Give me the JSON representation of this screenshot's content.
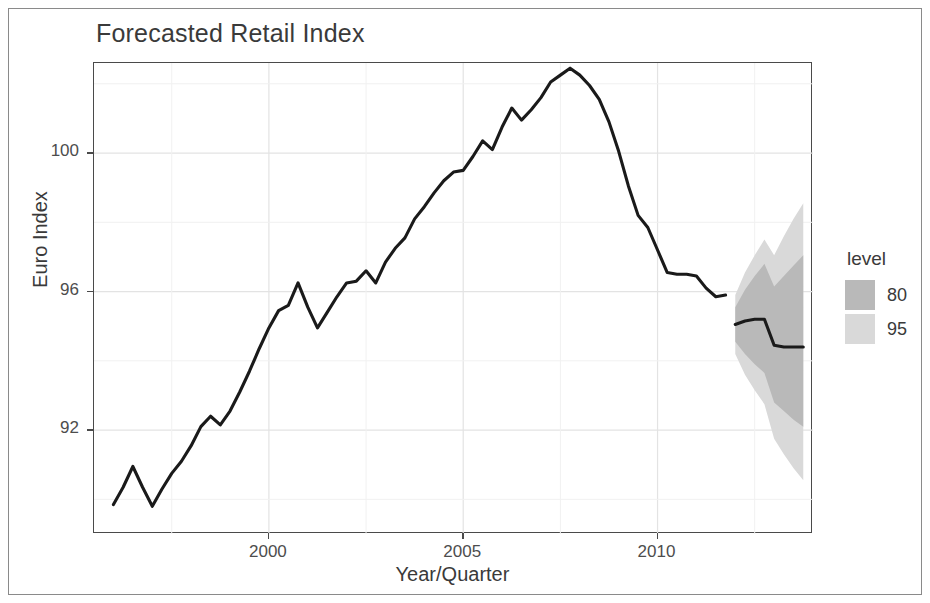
{
  "figure": {
    "title": "Forecasted Retail Index",
    "background": "#ffffff",
    "frame_color": "#8a8a8a"
  },
  "axes": {
    "ylabel": "Euro Index",
    "xlabel": "Year/Quarter",
    "y_ticks": [
      92,
      96,
      100
    ],
    "x_ticks": [
      2000,
      2005,
      2010
    ],
    "y_tick_labels": [
      "92",
      "96",
      "100"
    ],
    "x_tick_labels": [
      "2000",
      "2005",
      "2010"
    ],
    "grid": true,
    "panel_border_color": "#4a4a4a",
    "tick_label_color": "#4d4d4d"
  },
  "legend": {
    "title": "level",
    "position": "right",
    "items": [
      {
        "label": "80",
        "color": "#b9b9b9"
      },
      {
        "label": "95",
        "color": "#d9d9d9"
      }
    ]
  },
  "chart_data": {
    "type": "line",
    "title": "Forecasted Retail Index",
    "xlabel": "Year/Quarter",
    "ylabel": "Euro Index",
    "xlim": [
      1995.5,
      2014.0
    ],
    "ylim": [
      89.0,
      102.6
    ],
    "grid": true,
    "legend_position": "right",
    "legend_title": "level",
    "line_color": "#1a1a1a",
    "series": [
      {
        "name": "Euro Index (observed)",
        "type": "line",
        "x": [
          1996.0,
          1996.25,
          1996.5,
          1996.75,
          1997.0,
          1997.25,
          1997.5,
          1997.75,
          1998.0,
          1998.25,
          1998.5,
          1998.75,
          1999.0,
          1999.25,
          1999.5,
          1999.75,
          2000.0,
          2000.25,
          2000.5,
          2000.75,
          2001.0,
          2001.25,
          2001.5,
          2001.75,
          2002.0,
          2002.25,
          2002.5,
          2002.75,
          2003.0,
          2003.25,
          2003.5,
          2003.75,
          2004.0,
          2004.25,
          2004.5,
          2004.75,
          2005.0,
          2005.25,
          2005.5,
          2005.75,
          2006.0,
          2006.25,
          2006.5,
          2006.75,
          2007.0,
          2007.25,
          2007.5,
          2007.75,
          2008.0,
          2008.25,
          2008.5,
          2008.75,
          2009.0,
          2009.25,
          2009.5,
          2009.75,
          2010.0,
          2010.25,
          2010.5,
          2010.75,
          2011.0,
          2011.25,
          2011.5,
          2011.75
        ],
        "y": [
          89.85,
          90.35,
          90.95,
          90.35,
          89.8,
          90.3,
          90.75,
          91.1,
          91.55,
          92.1,
          92.4,
          92.15,
          92.55,
          93.1,
          93.7,
          94.35,
          94.95,
          95.45,
          95.6,
          96.25,
          95.55,
          94.95,
          95.4,
          95.85,
          96.25,
          96.3,
          96.6,
          96.25,
          96.85,
          97.25,
          97.55,
          98.1,
          98.45,
          98.85,
          99.2,
          99.45,
          99.5,
          99.9,
          100.35,
          100.1,
          100.75,
          101.3,
          100.95,
          101.25,
          101.6,
          102.05,
          102.25,
          102.45,
          102.25,
          101.95,
          101.55,
          100.9,
          100.05,
          99.05,
          98.2,
          97.85,
          97.2,
          96.55,
          96.5,
          96.5,
          96.45,
          96.1,
          95.85,
          95.9
        ]
      },
      {
        "name": "Forecast (point)",
        "type": "line",
        "x": [
          2012.0,
          2012.25,
          2012.5,
          2012.75,
          2013.0,
          2013.25,
          2013.5,
          2013.75
        ],
        "y": [
          95.05,
          95.15,
          95.2,
          95.2,
          94.45,
          94.4,
          94.4,
          94.4
        ]
      }
    ],
    "intervals": [
      {
        "level": 95,
        "color": "#d9d9d9",
        "x": [
          2012.0,
          2012.25,
          2012.5,
          2012.75,
          2013.0,
          2013.25,
          2013.5,
          2013.75
        ],
        "lower": [
          94.2,
          93.6,
          93.15,
          92.75,
          91.75,
          91.3,
          90.9,
          90.55
        ],
        "upper": [
          95.9,
          96.55,
          97.05,
          97.5,
          97.05,
          97.6,
          98.1,
          98.55
        ]
      },
      {
        "level": 80,
        "color": "#b9b9b9",
        "x": [
          2012.0,
          2012.25,
          2012.5,
          2012.75,
          2013.0,
          2013.25,
          2013.5,
          2013.75
        ],
        "lower": [
          94.55,
          94.2,
          93.9,
          93.65,
          92.8,
          92.55,
          92.3,
          92.1
        ],
        "upper": [
          95.55,
          96.05,
          96.45,
          96.8,
          96.15,
          96.45,
          96.75,
          97.05
        ]
      }
    ]
  }
}
